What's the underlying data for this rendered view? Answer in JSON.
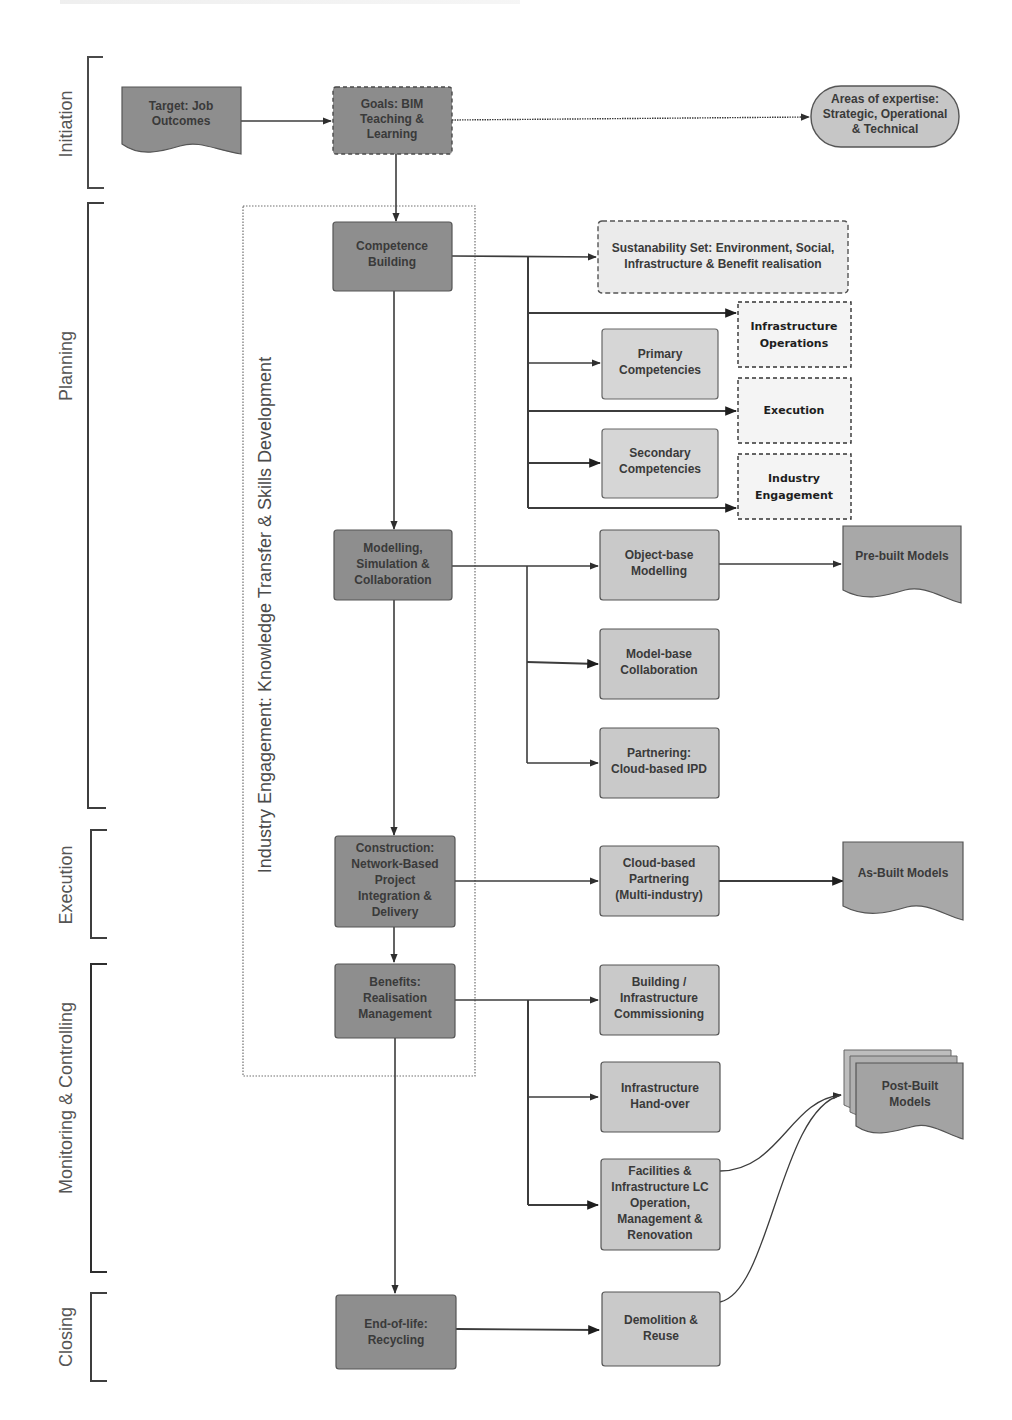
{
  "colors": {
    "dark_node": "#8e8e8e",
    "light_node": "#c9c9c9",
    "dashed_node": "#ebebeb",
    "border": "#5a5a5a",
    "line": "#3c3c3c",
    "text": "#3a3a3a"
  },
  "phases": [
    {
      "id": "initiation",
      "label": "Initiation"
    },
    {
      "id": "planning",
      "label": "Planning"
    },
    {
      "id": "execution",
      "label": "Execution"
    },
    {
      "id": "monitoring",
      "label": "Monitoring & Controlling"
    },
    {
      "id": "closing",
      "label": "Closing"
    }
  ],
  "swimlane": {
    "label": "Industry Engagement: Knowledge Transfer & Skills Development"
  },
  "nodes": {
    "target": {
      "lines": [
        "Target: Job",
        "Outcomes"
      ]
    },
    "goals": {
      "lines": [
        "Goals: BIM",
        "Teaching &",
        "Learning"
      ]
    },
    "expertise": {
      "lines": [
        "Areas of expertise:",
        "Strategic, Operational",
        "& Technical"
      ]
    },
    "competence": {
      "lines": [
        "Competence",
        "Building"
      ]
    },
    "sustainability": {
      "lines": [
        "Sustanability Set: Environment, Social,",
        "Infrastructure & Benefit realisation"
      ]
    },
    "infra_ops": {
      "lines": [
        "Infrastructure",
        "Operations"
      ]
    },
    "primary": {
      "lines": [
        "Primary",
        "Competencies"
      ]
    },
    "execution_box": {
      "lines": [
        "Execution"
      ]
    },
    "secondary": {
      "lines": [
        "Secondary",
        "Competencies"
      ]
    },
    "industry_eng": {
      "lines": [
        "Industry",
        "Engagement"
      ]
    },
    "modelling": {
      "lines": [
        "Modelling,",
        "Simulation &",
        "Collaboration"
      ]
    },
    "object_base": {
      "lines": [
        "Object-base",
        "Modelling"
      ]
    },
    "prebuilt": {
      "lines": [
        "Pre-built Models"
      ]
    },
    "model_base": {
      "lines": [
        "Model-base",
        "Collaboration"
      ]
    },
    "partnering": {
      "lines": [
        "Partnering:",
        "Cloud-based IPD"
      ]
    },
    "construction": {
      "lines": [
        "Construction:",
        "Network-Based",
        "Project",
        "Integration &",
        "Delivery"
      ]
    },
    "cloud_partnering": {
      "lines": [
        "Cloud-based",
        "Partnering",
        "(Multi-industry)"
      ]
    },
    "asbuilt": {
      "lines": [
        "As-Built Models"
      ]
    },
    "benefits": {
      "lines": [
        "Benefits:",
        "Realisation",
        "Management"
      ]
    },
    "commissioning": {
      "lines": [
        "Building /",
        "Infrastructure",
        "Commissioning"
      ]
    },
    "handover": {
      "lines": [
        "Infrastructure",
        "Hand-over"
      ]
    },
    "facilities": {
      "lines": [
        "Facilities &",
        "Infrastructure LC",
        "Operation,",
        "Management &",
        "Renovation"
      ]
    },
    "postbuilt": {
      "lines": [
        "Post-Built",
        "Models"
      ]
    },
    "endoflife": {
      "lines": [
        "End-of-life:",
        "Recycling"
      ]
    },
    "demolition": {
      "lines": [
        "Demolition &",
        "Reuse"
      ]
    }
  }
}
